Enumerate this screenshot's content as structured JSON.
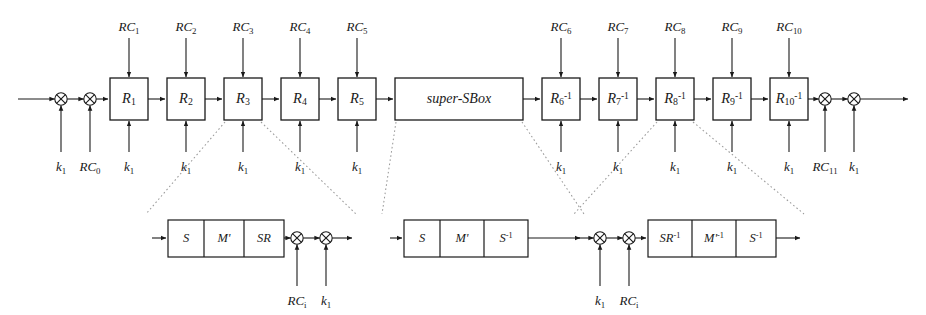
{
  "figure": {
    "type": "block-diagram"
  },
  "main_chain": {
    "input_xors": [
      {
        "id": "xor-in-1",
        "label_html": "k<sub>1</sub>",
        "label_text": "k1"
      },
      {
        "id": "xor-in-2",
        "label_html": "RC<sub>0</sub>",
        "label_text": "RC0"
      }
    ],
    "output_xors": [
      {
        "id": "xor-out-1",
        "label_html": "RC<sub>11</sub>",
        "label_text": "RC11"
      },
      {
        "id": "xor-out-2",
        "label_html": "k<sub>1</sub>",
        "label_text": "k1"
      }
    ],
    "blocks": [
      {
        "id": "block-r1",
        "label_html": "R<sub>1</sub>",
        "label_text": "R1",
        "top_label_html": "RC<sub>1</sub>",
        "top_label_text": "RC1",
        "bottom_label_html": "k<sub>1</sub>",
        "bottom_label_text": "k1"
      },
      {
        "id": "block-r2",
        "label_html": "R<sub>2</sub>",
        "label_text": "R2",
        "top_label_html": "RC<sub>2</sub>",
        "top_label_text": "RC2",
        "bottom_label_html": "k<sub>1</sub>",
        "bottom_label_text": "k1"
      },
      {
        "id": "block-r3",
        "label_html": "R<sub>3</sub>",
        "label_text": "R3",
        "top_label_html": "RC<sub>3</sub>",
        "top_label_text": "RC3",
        "bottom_label_html": "k<sub>1</sub>",
        "bottom_label_text": "k1"
      },
      {
        "id": "block-r4",
        "label_html": "R<sub>4</sub>",
        "label_text": "R4",
        "top_label_html": "RC<sub>4</sub>",
        "top_label_text": "RC4",
        "bottom_label_html": "k<sub>1</sub>",
        "bottom_label_text": "k1"
      },
      {
        "id": "block-r5",
        "label_html": "R<sub>5</sub>",
        "label_text": "R5",
        "top_label_html": "RC<sub>5</sub>",
        "top_label_text": "RC5",
        "bottom_label_html": "k<sub>1</sub>",
        "bottom_label_text": "k1"
      },
      {
        "id": "block-supersbox",
        "label_html": "super-SBox",
        "label_text": "super-SBox",
        "top_label_html": "",
        "top_label_text": "",
        "bottom_label_html": "",
        "bottom_label_text": ""
      },
      {
        "id": "block-r6i",
        "label_html": "R<sub>6</sub><sup>-1</sup>",
        "label_text": "R6^-1",
        "top_label_html": "RC<sub>6</sub>",
        "top_label_text": "RC6",
        "bottom_label_html": "k<sub>1</sub>",
        "bottom_label_text": "k1"
      },
      {
        "id": "block-r7i",
        "label_html": "R<sub>7</sub><sup>-1</sup>",
        "label_text": "R7^-1",
        "top_label_html": "RC<sub>7</sub>",
        "top_label_text": "RC7",
        "bottom_label_html": "k<sub>1</sub>",
        "bottom_label_text": "k1"
      },
      {
        "id": "block-r8i",
        "label_html": "R<sub>8</sub><sup>-1</sup>",
        "label_text": "R8^-1",
        "top_label_html": "RC<sub>8</sub>",
        "top_label_text": "RC8",
        "bottom_label_html": "k<sub>1</sub>",
        "bottom_label_text": "k1"
      },
      {
        "id": "block-r9i",
        "label_html": "R<sub>9</sub><sup>-1</sup>",
        "label_text": "R9^-1",
        "top_label_html": "RC<sub>9</sub>",
        "top_label_text": "RC9",
        "bottom_label_html": "k<sub>1</sub>",
        "bottom_label_text": "k1"
      },
      {
        "id": "block-r10i",
        "label_html": "R<sub>10</sub><sup>-1</sup>",
        "label_text": "R10^-1",
        "top_label_html": "RC<sub>10</sub>",
        "top_label_text": "RC10",
        "bottom_label_html": "k<sub>1</sub>",
        "bottom_label_text": "k1"
      }
    ]
  },
  "expansions": [
    {
      "id": "expansion-round-forward",
      "source_block": "block-r3",
      "cells": [
        {
          "label_html": "S",
          "label_text": "S"
        },
        {
          "label_html": "M'",
          "label_text": "M'"
        },
        {
          "label_html": "SR",
          "label_text": "SR"
        }
      ],
      "leading_xors": [],
      "trailing_xors": [
        {
          "label_html": "RC<sub>i</sub>",
          "label_text": "RCi"
        },
        {
          "label_html": "k<sub>1</sub>",
          "label_text": "k1"
        }
      ]
    },
    {
      "id": "expansion-supersbox",
      "source_block": "block-supersbox",
      "cells": [
        {
          "label_html": "S",
          "label_text": "S"
        },
        {
          "label_html": "M'",
          "label_text": "M'"
        },
        {
          "label_html": "S<sup>-1</sup>",
          "label_text": "S^-1"
        }
      ],
      "leading_xors": [],
      "trailing_xors": []
    },
    {
      "id": "expansion-round-inverse",
      "source_block": "block-r8i",
      "cells": [
        {
          "label_html": "SR<sup>-1</sup>",
          "label_text": "SR^-1"
        },
        {
          "label_html": "M'<sup>-1</sup>",
          "label_text": "M'^-1"
        },
        {
          "label_html": "S<sup>-1</sup>",
          "label_text": "S^-1"
        }
      ],
      "leading_xors": [
        {
          "label_html": "k<sub>1</sub>",
          "label_text": "k1"
        },
        {
          "label_html": "RC<sub>i</sub>",
          "label_text": "RCi"
        }
      ],
      "trailing_xors": []
    }
  ],
  "colors": {
    "stroke": "#1a1a1a",
    "background": "#ffffff",
    "dotted": "#8a8a8a"
  }
}
